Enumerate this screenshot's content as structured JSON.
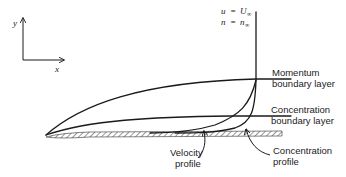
{
  "figure": {
    "axes": {
      "x_label": "x",
      "y_label": "y"
    },
    "freestream": {
      "velocity": {
        "lhs": "u",
        "eq": "=",
        "rhs": "U",
        "sub": "∞"
      },
      "concentration": {
        "lhs": "n",
        "eq": "=",
        "rhs": "n",
        "sub": "∞"
      }
    },
    "labels": {
      "momentum_line1": "Momentum",
      "momentum_line2": "boundary layer",
      "concentration_bl_line1": "Concentration",
      "concentration_bl_line2": "boundary layer",
      "velocity_profile_line1": "Velocity",
      "velocity_profile_line2": "profile",
      "concentration_profile_line1": "Concentration",
      "concentration_profile_line2": "profile"
    },
    "colors": {
      "line": "#1a1a1a",
      "background": "#ffffff"
    }
  }
}
